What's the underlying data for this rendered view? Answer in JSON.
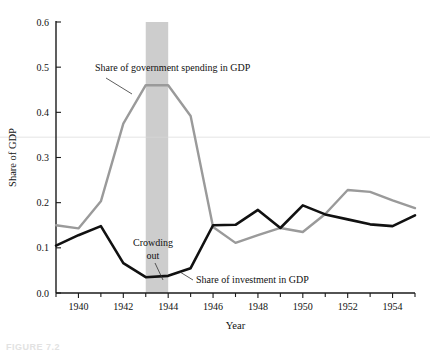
{
  "figure": {
    "caption": "FIGURE 7.2"
  },
  "chart_data": {
    "type": "line",
    "title": "",
    "xlabel": "Year",
    "ylabel": "Share of GDP",
    "xlim": [
      1939,
      1955
    ],
    "ylim": [
      0.0,
      0.6
    ],
    "grid": false,
    "legend_position": "inline-annotations",
    "x_ticks_major": [
      1940,
      1942,
      1944,
      1946,
      1948,
      1950,
      1952,
      1954
    ],
    "x_ticks_minor": [
      1939,
      1941,
      1943,
      1945,
      1947,
      1949,
      1951,
      1953,
      1955
    ],
    "y_ticks": [
      "0.0",
      "0.1",
      "0.2",
      "0.3",
      "0.4",
      "0.5",
      "0.6"
    ],
    "y_tick_values": [
      0.0,
      0.1,
      0.2,
      0.3,
      0.4,
      0.5,
      0.6
    ],
    "x": [
      1939,
      1940,
      1941,
      1942,
      1943,
      1944,
      1945,
      1946,
      1947,
      1948,
      1949,
      1950,
      1951,
      1952,
      1953,
      1954,
      1955
    ],
    "series": [
      {
        "name": "Share of government spending in GDP",
        "color": "#9a9a9a",
        "values": [
          0.15,
          0.143,
          0.203,
          0.375,
          0.46,
          0.46,
          0.392,
          0.146,
          0.111,
          0.128,
          0.144,
          0.135,
          0.175,
          0.228,
          0.224,
          0.205,
          0.188
        ]
      },
      {
        "name": "Share of investment in GDP",
        "color": "#111111",
        "values": [
          0.105,
          0.128,
          0.148,
          0.066,
          0.035,
          0.038,
          0.055,
          0.15,
          0.151,
          0.184,
          0.144,
          0.194,
          0.174,
          0.163,
          0.152,
          0.148,
          0.172
        ]
      }
    ],
    "shaded_band": {
      "label": "Crowding out",
      "x_start": 1943,
      "x_end": 1944,
      "color": "#c4c4c4"
    },
    "reference_rule": {
      "value": 0.345,
      "color": "#d9d9d9"
    },
    "annotations": [
      {
        "name": "gov-spending-label",
        "text": "Share of government spending in GDP",
        "x": 95,
        "y": 71,
        "anchor": "start",
        "leader": [
          [
            106,
            78
          ],
          [
            132,
            94
          ]
        ]
      },
      {
        "name": "crowding-out-label-line1",
        "text": "Crowding",
        "x": 153,
        "y": 246,
        "anchor": "middle",
        "leader": []
      },
      {
        "name": "crowding-out-label-line2",
        "text": "out",
        "x": 153,
        "y": 259,
        "anchor": "middle",
        "leader": [
          [
            155,
            263
          ],
          [
            163,
            280
          ]
        ]
      },
      {
        "name": "investment-label",
        "text": "Share of investment in GDP",
        "x": 196,
        "y": 283,
        "anchor": "start",
        "leader": [
          [
            193,
            280
          ],
          [
            180,
            272
          ]
        ]
      }
    ]
  }
}
